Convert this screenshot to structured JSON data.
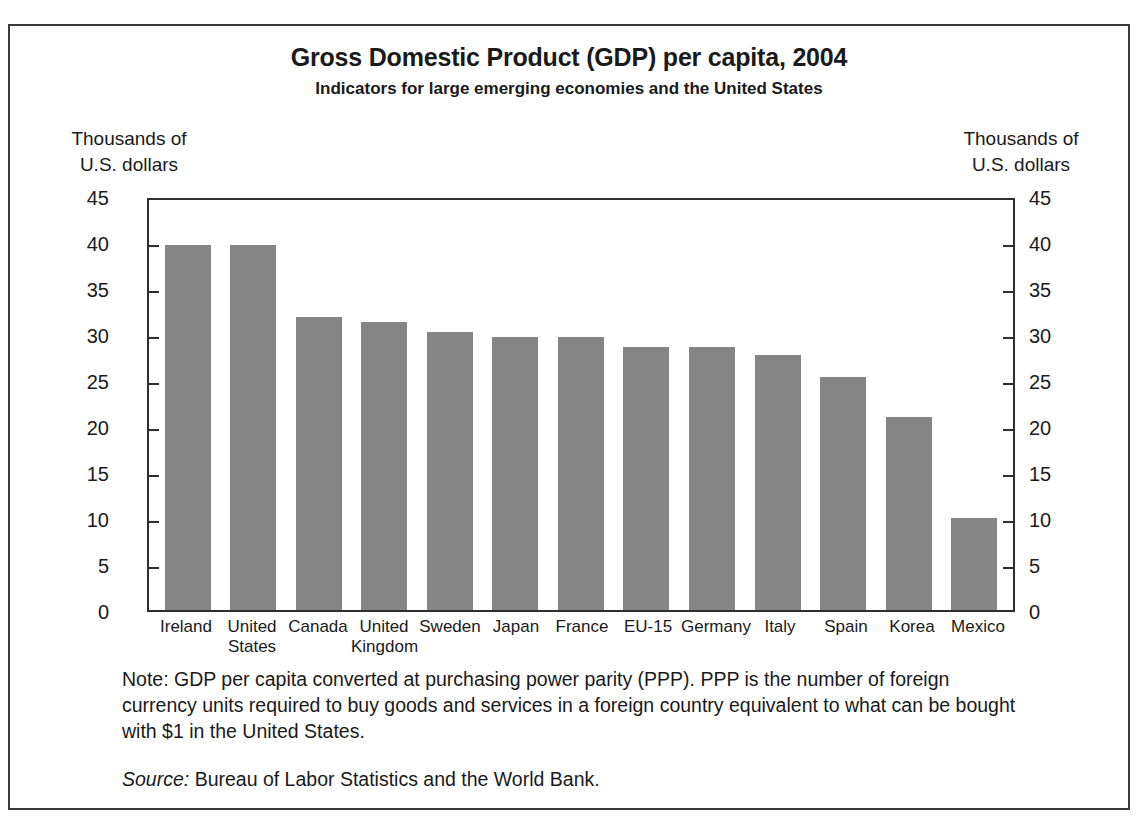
{
  "chart_data": {
    "type": "bar",
    "title": "Gross Domestic Product (GDP) per capita, 2004",
    "subtitle": "Indicators for large emerging economies and the United States",
    "xlabel": "",
    "ylabel": "Thousands of\nU.S. dollars",
    "ylabel_right": "Thousands of\nU.S. dollars",
    "ylim": [
      0,
      45
    ],
    "yticks": [
      0,
      5,
      10,
      15,
      20,
      25,
      30,
      35,
      40,
      45
    ],
    "ytick_labels": [
      "0",
      "5",
      "10",
      "15",
      "20",
      "25",
      "30",
      "35",
      "40",
      "45"
    ],
    "grid": false,
    "legend": "none",
    "bar_color": "#858585",
    "axis_color": "#2e2e2e",
    "categories": [
      "Ireland",
      "United\nStates",
      "Canada",
      "United\nKingdom",
      "Sweden",
      "Japan",
      "France",
      "EU-15",
      "Germany",
      "Italy",
      "Spain",
      "Korea",
      "Mexico"
    ],
    "values": [
      40.1,
      40.1,
      32.2,
      31.6,
      30.5,
      30.0,
      30.0,
      28.9,
      28.9,
      28.0,
      25.6,
      21.2,
      10.1
    ],
    "series": [
      {
        "name": "GDP per capita (PPP)",
        "values": [
          40.1,
          40.1,
          32.2,
          31.6,
          30.5,
          30.0,
          30.0,
          28.9,
          28.9,
          28.0,
          25.6,
          21.2,
          10.1
        ]
      }
    ]
  },
  "footnotes": {
    "note": "Note:  GDP per capita converted at purchasing power parity (PPP). PPP is the number of foreign currency units required to buy goods and services in a foreign country equivalent to what can be bought with $1 in the United States.",
    "source_label": "Source:",
    "source_text": "Bureau of Labor Statistics and the World Bank."
  }
}
